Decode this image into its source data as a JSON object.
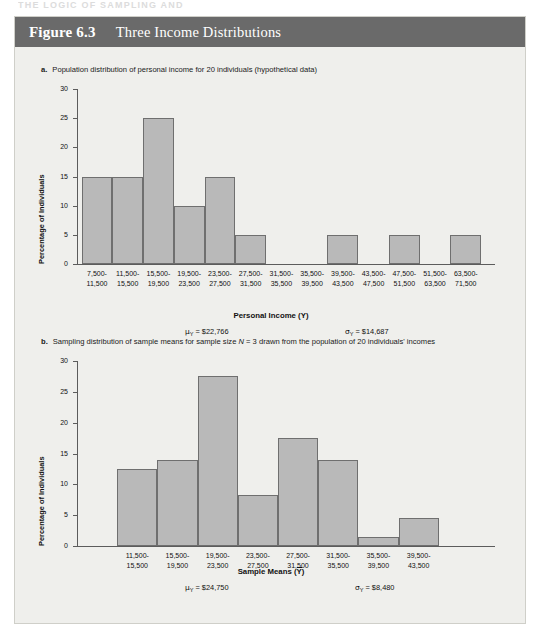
{
  "running_head": "THE LOGIC OF SAMPLING AND",
  "figure": {
    "label": "Figure 6.3",
    "title": "Three Income Distributions"
  },
  "panel_a": {
    "bullet": "a.",
    "caption": "Population distribution of personal income for 20 individuals (hypothetical data)",
    "ylabel": "Percentage of Individuals",
    "xlabel": "Personal Income (Y)",
    "mean_label": "μ",
    "mean_sub": "Y",
    "mean_value": "= $22,766",
    "sd_label": "σ",
    "sd_sub": "Y",
    "sd_value": "= $14,687"
  },
  "panel_b": {
    "bullet": "b.",
    "caption_part1": "Sampling distribution of sample means for sample size ",
    "caption_italic": "N",
    "caption_part2": " = 3 drawn from the population of 20 individuals' incomes",
    "ylabel": "Percentage of Individuals",
    "xlabel_pre": "Sample Means (",
    "xlabel_var": "Y",
    "xlabel_post": ")",
    "mean_label": "μ",
    "mean_sub": "Y",
    "mean_value": "= $24,750",
    "sd_label": "σ",
    "sd_sub": "Y",
    "sd_value": "= $8,480"
  },
  "colors": {
    "header_bg": "#6a6a6a",
    "panel_bg": "#efefec",
    "bar_fill": "#b9b9b9",
    "bar_stroke": "#6f6f6f",
    "axis": "#5c5c5c"
  },
  "chart_data": [
    {
      "type": "bar",
      "title": "Population distribution of personal income for 20 individuals (hypothetical data)",
      "xlabel": "Personal Income (Y)",
      "ylabel": "Percentage of Individuals",
      "ylim": [
        0,
        30
      ],
      "yticks": [
        0,
        5,
        10,
        15,
        20,
        25,
        30
      ],
      "grid": false,
      "legend": "none",
      "categories": [
        "7,500-\n11,500",
        "11,500-\n15,500",
        "15,500-\n19,500",
        "19,500-\n23,500",
        "23,500-\n27,500",
        "27,500-\n31,500",
        "31,500-\n35,500",
        "35,500-\n39,500",
        "39,500-\n43,500",
        "43,500-\n47,500",
        "47,500-\n51,500",
        "51,500-\n63,500",
        "63,500-\n71,500"
      ],
      "values": [
        15,
        15,
        25,
        10,
        15,
        5,
        0,
        0,
        5,
        0,
        5,
        0,
        5
      ],
      "annotations": [
        "μY = $22,766",
        "σY = $14,687"
      ]
    },
    {
      "type": "bar",
      "title": "Sampling distribution of sample means for sample size N = 3 drawn from the population of 20 individuals' incomes",
      "xlabel": "Sample Means (Ȳ)",
      "ylabel": "Percentage of Individuals",
      "ylim": [
        0,
        30
      ],
      "yticks": [
        0,
        5,
        10,
        15,
        20,
        25,
        30
      ],
      "grid": false,
      "legend": "none",
      "categories": [
        "11,500-\n15,500",
        "15,500-\n19,500",
        "19,500-\n23,500",
        "23,500-\n27,500",
        "27,500-\n31,500",
        "31,500-\n35,500",
        "35,500-\n39,500",
        "39,500-\n43,500"
      ],
      "values": [
        12.5,
        14,
        27.5,
        8.3,
        17.5,
        14,
        1.5,
        4.5
      ],
      "annotations": [
        "μY = $24,750",
        "σY = $8,480"
      ]
    }
  ]
}
